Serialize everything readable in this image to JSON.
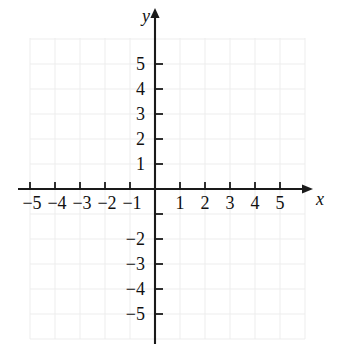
{
  "figure": {
    "kind": "cartesian-coordinate-plane",
    "background_color": "#ffffff",
    "axis_color": "#1a1a1a",
    "grid_color": "#ededed",
    "label_color": "#111111"
  },
  "axes": {
    "x": {
      "name": "x",
      "min": -5,
      "max": 5,
      "origin_px": 155,
      "step_px": 25,
      "arrow": "right"
    },
    "y": {
      "name": "y",
      "min": -5,
      "max": 5,
      "origin_px": 189,
      "step_px": 25,
      "arrow": "up"
    }
  },
  "ticks": {
    "x_values": [
      -5,
      -4,
      -3,
      -2,
      -1,
      1,
      2,
      3,
      4,
      5
    ],
    "y_values": [
      5,
      4,
      3,
      2,
      1,
      -1,
      -2,
      -3,
      -4,
      -5
    ],
    "x_labels": [
      {
        "value": -5,
        "text": "−5"
      },
      {
        "value": -4,
        "text": "−4"
      },
      {
        "value": -3,
        "text": "−3"
      },
      {
        "value": -2,
        "text": "−2"
      },
      {
        "value": -1,
        "text": "−1"
      },
      {
        "value": 1,
        "text": "1"
      },
      {
        "value": 2,
        "text": "2"
      },
      {
        "value": 3,
        "text": "3"
      },
      {
        "value": 4,
        "text": "4"
      },
      {
        "value": 5,
        "text": "5"
      }
    ],
    "y_labels": [
      {
        "value": 5,
        "text": "5"
      },
      {
        "value": 4,
        "text": "4"
      },
      {
        "value": 3,
        "text": "3"
      },
      {
        "value": 2,
        "text": "2"
      },
      {
        "value": 1,
        "text": "1"
      },
      {
        "value": -2,
        "text": "−2"
      },
      {
        "value": -3,
        "text": "−3"
      },
      {
        "value": -4,
        "text": "−4"
      },
      {
        "value": -5,
        "text": "−5"
      }
    ]
  },
  "grid": {
    "visible": true,
    "left_px": 30,
    "right_px": 305,
    "top_px": 38,
    "bottom_px": 339,
    "x_lines": [
      -5,
      -4,
      -3,
      -2,
      -1,
      0,
      1,
      2,
      3,
      4,
      5,
      6
    ],
    "y_lines": [
      6,
      5,
      4,
      3,
      2,
      1,
      0,
      -1,
      -2,
      -3,
      -4,
      -5,
      -6
    ]
  },
  "plotted": {
    "points": [],
    "curves": []
  }
}
